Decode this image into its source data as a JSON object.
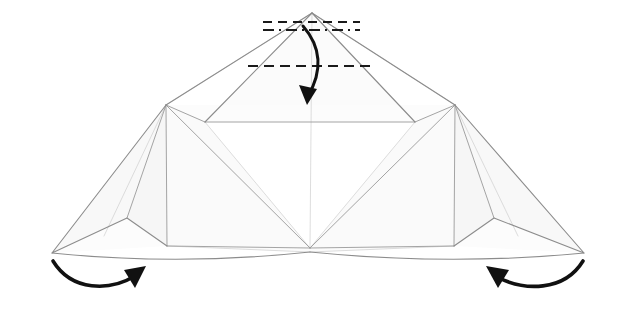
{
  "diagram": {
    "background_color": "#ffffff",
    "canvas": {
      "width": 620,
      "height": 318
    },
    "style": {
      "fold_line_color": "#9a9a9a",
      "edge_line_color": "#8c8c8c",
      "soft_fold_color": "#c9c9c9",
      "facet_fill_light": "#fdfdfd",
      "facet_fill_mid": "#f7f7f7",
      "facet_fill_shade": "#f2f2f2",
      "crease_color": "#1a1a1a",
      "arrow_color": "#111111",
      "fold_line_width": 0.9,
      "edge_line_width": 1.1,
      "crease_line_width": 2.0,
      "arrow_line_width": 3.4
    },
    "creases": [
      {
        "name": "top-valley-fold-upper",
        "type": "dashed",
        "label": "valley fold line at flap tip",
        "x1": 263,
        "y1": 22,
        "x2": 360,
        "y2": 22,
        "dash": "9,6"
      },
      {
        "name": "top-reference-line",
        "type": "dash-dot",
        "label": "reference / mountain line",
        "x1": 263,
        "y1": 30,
        "x2": 360,
        "y2": 30,
        "dash": "11,5,2,5"
      },
      {
        "name": "mid-valley-fold",
        "type": "dashed",
        "label": "valley fold across center flap",
        "x1": 248,
        "y1": 66,
        "x2": 372,
        "y2": 66,
        "dash": "10,6"
      }
    ],
    "arrows": [
      {
        "name": "center-fold-down-arrow",
        "label": "fold top point down",
        "direction": "down",
        "path": "M 303 26 C 322 48 322 72 308 96",
        "head_points": "308,104 300,86 316,88"
      },
      {
        "name": "left-wing-fold-arrow",
        "label": "swing left wing up and in",
        "direction": "up-right",
        "path": "M 53 261 C 72 292 110 291 135 276",
        "head_points": "145,268 127,271 134,287"
      },
      {
        "name": "right-wing-fold-arrow",
        "label": "swing right wing up and in",
        "direction": "up-left",
        "path": "M 583 261 C 564 292 524 291 497 277",
        "head_points": "487,269 505,272 498,288"
      }
    ],
    "vertices": {
      "apex": {
        "x": 312,
        "y": 13
      },
      "left_shoulder": {
        "x": 166,
        "y": 105
      },
      "right_shoulder": {
        "x": 455,
        "y": 105
      },
      "left_inner": {
        "x": 205,
        "y": 122
      },
      "right_inner": {
        "x": 415,
        "y": 122
      },
      "bottom_center": {
        "x": 310,
        "y": 248
      },
      "left_tip": {
        "x": 52,
        "y": 253
      },
      "right_tip": {
        "x": 584,
        "y": 253
      },
      "left_notch": {
        "x": 127,
        "y": 218
      },
      "right_notch": {
        "x": 494,
        "y": 218
      },
      "left_foot": {
        "x": 167,
        "y": 246
      },
      "right_foot": {
        "x": 454,
        "y": 246
      }
    }
  }
}
